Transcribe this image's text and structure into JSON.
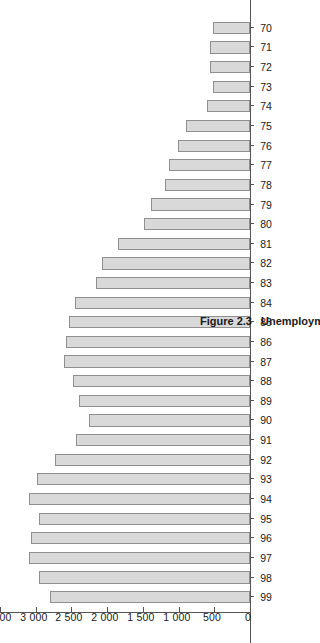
{
  "figure": {
    "number": "Figure 2.3",
    "title": "Unemployment in France, 1970–99",
    "unit_label": "(thousands)"
  },
  "chart_data": {
    "type": "bar",
    "title": "Unemployment in France, 1970–99",
    "xlabel": "",
    "ylabel": "(thousands)",
    "orientation": "horizontal",
    "grid": false,
    "legend": "none",
    "ylim": [
      0,
      3500
    ],
    "yticks": [
      0,
      500,
      1000,
      1500,
      2000,
      2500,
      3000,
      3500
    ],
    "ytick_labels": [
      "0",
      "500",
      "1 000",
      "1 500",
      "2 000",
      "2 500",
      "3 000",
      "3 500"
    ],
    "categories": [
      "70",
      "71",
      "72",
      "73",
      "74",
      "75",
      "76",
      "77",
      "78",
      "79",
      "80",
      "81",
      "82",
      "83",
      "84",
      "85",
      "86",
      "87",
      "88",
      "89",
      "90",
      "91",
      "92",
      "93",
      "94",
      "95",
      "96",
      "97",
      "98",
      "99"
    ],
    "values": [
      520,
      560,
      560,
      520,
      600,
      900,
      1010,
      1130,
      1190,
      1380,
      1480,
      1850,
      2070,
      2160,
      2450,
      2540,
      2570,
      2600,
      2480,
      2400,
      2260,
      2440,
      2730,
      2980,
      3090,
      2950,
      3060,
      3090,
      2960,
      2800
    ]
  }
}
